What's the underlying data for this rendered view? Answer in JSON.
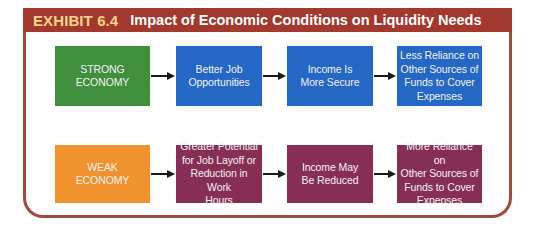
{
  "exhibit": {
    "label": "EXHIBIT 6.4",
    "title": "Impact of Economic Conditions on Liquidity Needs"
  },
  "colors": {
    "header_bg": "#a3392e",
    "label_text": "#f7d58a",
    "frame_border": "#a04b3c",
    "strong_economy": "#3f8f3c",
    "strong_flow": "#2467c4",
    "weak_economy": "#f0922e",
    "weak_flow": "#862e54",
    "arrow": "#1a1a1a"
  },
  "rows": [
    {
      "name": "strong",
      "boxes": [
        {
          "lines": [
            "STRONG",
            "ECONOMY"
          ]
        },
        {
          "lines": [
            "Better Job",
            "Opportunities"
          ]
        },
        {
          "lines": [
            "Income Is",
            "More Secure"
          ]
        },
        {
          "lines": [
            "Less Reliance on",
            "Other Sources of",
            "Funds to Cover",
            "Expenses"
          ]
        }
      ]
    },
    {
      "name": "weak",
      "boxes": [
        {
          "lines": [
            "WEAK",
            "ECONOMY"
          ]
        },
        {
          "lines": [
            "Greater Potential",
            "for Job Layoff or",
            "Reduction in Work",
            "Hours"
          ]
        },
        {
          "lines": [
            "Income May",
            "Be Reduced"
          ]
        },
        {
          "lines": [
            "More Reliance on",
            "Other Sources of",
            "Funds to Cover",
            "Expenses"
          ]
        }
      ]
    }
  ]
}
